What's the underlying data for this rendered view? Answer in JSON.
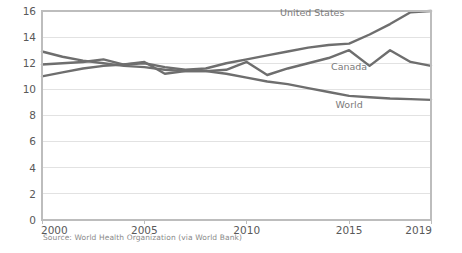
{
  "chart_data": {
    "type": "line",
    "title": "",
    "subtitle": "",
    "xlabel": "",
    "ylabel": "",
    "xlim": [
      2000,
      2019
    ],
    "ylim": [
      0,
      16
    ],
    "grid": true,
    "legend_position": "inline-right",
    "source_note": "Source: World Health Organization (via World Bank)",
    "x": [
      2000,
      2001,
      2002,
      2003,
      2004,
      2005,
      2006,
      2007,
      2008,
      2009,
      2010,
      2011,
      2012,
      2013,
      2014,
      2015,
      2016,
      2017,
      2018,
      2019
    ],
    "xticks": [
      2000,
      2005,
      2010,
      2015,
      2019
    ],
    "xticklabels": [
      "2000",
      "2005",
      "2010",
      "2015",
      "2019"
    ],
    "yticks": [
      0,
      2,
      4,
      6,
      8,
      10,
      12,
      14,
      16
    ],
    "yticklabels": [
      "0",
      "2",
      "4",
      "6",
      "8",
      "10",
      "12",
      "14",
      "16"
    ],
    "series": [
      {
        "name": "United States",
        "color": "#6e6e6e",
        "label_x": 2013.2,
        "label_y": 15.6,
        "values": [
          11.0,
          11.3,
          11.6,
          11.8,
          11.9,
          12.0,
          11.7,
          11.5,
          11.6,
          12.0,
          12.3,
          12.6,
          12.9,
          13.2,
          13.4,
          13.5,
          14.2,
          15.0,
          15.9,
          16.0
        ]
      },
      {
        "name": "Canada",
        "color": "#6e6e6e",
        "label_x": 2015.0,
        "label_y": 11.5,
        "values": [
          11.9,
          12.0,
          12.1,
          12.3,
          11.9,
          12.1,
          11.2,
          11.4,
          11.4,
          11.5,
          12.1,
          11.1,
          11.6,
          12.0,
          12.4,
          13.0,
          11.8,
          13.0,
          12.1,
          11.8
        ]
      },
      {
        "name": "World",
        "color": "#6e6e6e",
        "label_x": 2015.0,
        "label_y": 8.6,
        "values": [
          12.9,
          12.5,
          12.2,
          12.0,
          11.8,
          11.7,
          11.5,
          11.4,
          11.4,
          11.2,
          10.9,
          10.6,
          10.4,
          10.1,
          9.8,
          9.5,
          9.4,
          9.3,
          9.25,
          9.2
        ]
      }
    ]
  },
  "axis": {
    "y_tick_0": "0",
    "y_tick_2": "2",
    "y_tick_4": "4",
    "y_tick_6": "6",
    "y_tick_8": "8",
    "y_tick_10": "10",
    "y_tick_12": "12",
    "y_tick_14": "14",
    "y_tick_16": "16",
    "x_tick_2000": "2000",
    "x_tick_2005": "2005",
    "x_tick_2010": "2010",
    "x_tick_2015": "2015",
    "x_tick_2019": "2019"
  },
  "labels": {
    "united_states": "United States",
    "canada": "Canada",
    "world": "World"
  },
  "footer": {
    "source": "Source: World Health Organization (via World Bank)"
  },
  "colors": {
    "line": "#6e6e6e",
    "grid": "#e2e2e2",
    "border": "#bdbdbd",
    "tick_text": "#595959",
    "series_label": "#7a7a7a",
    "source_text": "#8a8a8a",
    "background": "#ffffff"
  }
}
